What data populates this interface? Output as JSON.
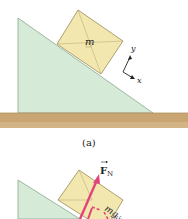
{
  "figure": {
    "panel_a": {
      "caption": "(a)",
      "block_label": "m",
      "axes": {
        "x_label": "x",
        "y_label": "y"
      }
    },
    "panel_b": {
      "force_label": "F",
      "force_subscript": "N",
      "component_label_mg": "mg",
      "component_label_sin": "sin"
    },
    "colors": {
      "incline": "#d5ead7",
      "incline_edge": "#8aa890",
      "block": "#f3e7b0",
      "block_edge": "#9b8a55",
      "ground": "#c9a574",
      "ground_dark": "#b08f60",
      "force": "#e0457a"
    }
  }
}
